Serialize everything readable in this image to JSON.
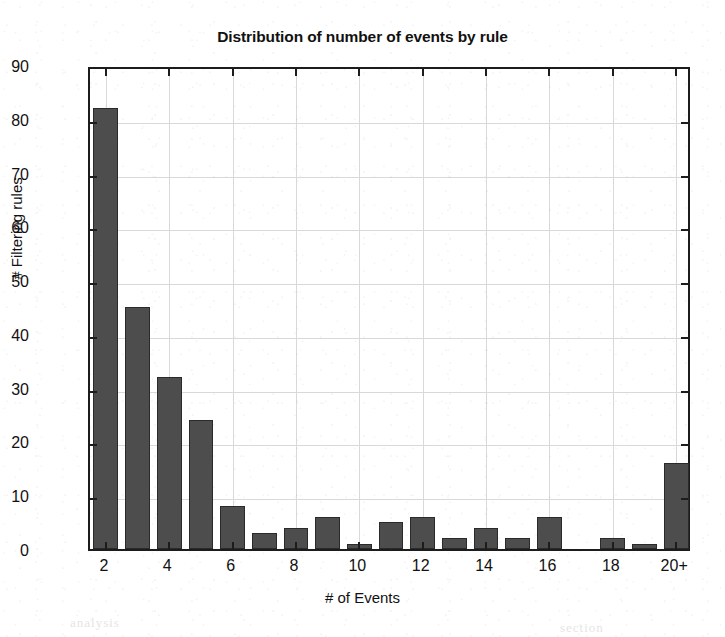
{
  "chart_data": {
    "type": "bar",
    "title": "Distribution of number of events by rule",
    "xlabel": "# of Events",
    "ylabel": "# Filtering rules",
    "categories": [
      "2",
      "3",
      "4",
      "5",
      "6",
      "7",
      "8",
      "9",
      "10",
      "11",
      "12",
      "13",
      "14",
      "15",
      "16",
      "17",
      "18",
      "19",
      "20+"
    ],
    "values": [
      82,
      45,
      32,
      24,
      8,
      3,
      4,
      6,
      1,
      5,
      6,
      2,
      4,
      2,
      6,
      0,
      2,
      1,
      16
    ],
    "xtick_labels": [
      "2",
      "4",
      "6",
      "8",
      "10",
      "12",
      "14",
      "16",
      "18",
      "20+"
    ],
    "xtick_categories": [
      "2",
      "4",
      "6",
      "8",
      "10",
      "12",
      "14",
      "16",
      "18",
      "20+"
    ],
    "ytick_labels": [
      "0",
      "10",
      "20",
      "30",
      "40",
      "50",
      "60",
      "70",
      "80",
      "90"
    ],
    "ylim": [
      0,
      90
    ],
    "ytick_step": 10,
    "grid": true,
    "legend": "none",
    "bar_color": "#4d4d4d",
    "bar_edge_color": "#2a2a2a",
    "axis_color": "#1c1c1c",
    "grid_color": "#d9d9d9",
    "background": "#ffffff"
  },
  "scan_artifacts": {
    "ghost_text": [
      "of the page",
      "rule set",
      "number",
      "events",
      "filtering",
      "analysis",
      "section"
    ]
  }
}
